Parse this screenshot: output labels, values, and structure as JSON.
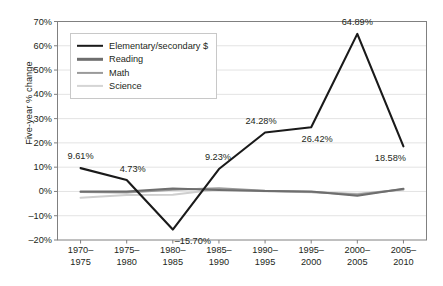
{
  "chart_data": {
    "type": "line",
    "title": "",
    "xlabel": "",
    "ylabel": "Five-year % change",
    "ylim": [
      -20,
      70
    ],
    "grid": true,
    "legend_position": "upper-left",
    "categories": [
      "1970–1975",
      "1975–1980",
      "1980–1985",
      "1985–1990",
      "1990–1995",
      "1995–2000",
      "2000–2005",
      "2005–2010"
    ],
    "category_lines": [
      [
        "1970–",
        "1975"
      ],
      [
        "1975–",
        "1980"
      ],
      [
        "1980–",
        "1985"
      ],
      [
        "1985–",
        "1990"
      ],
      [
        "1990–",
        "1995"
      ],
      [
        "1995–",
        "2000"
      ],
      [
        "2000–",
        "2005"
      ],
      [
        "2005–",
        "2010"
      ]
    ],
    "ytick_labels": [
      "70%",
      "60%",
      "50%",
      "40%",
      "30%",
      "20%",
      "10%",
      "0%",
      "–10%",
      "–20%"
    ],
    "ytick_values": [
      70,
      60,
      50,
      40,
      30,
      20,
      10,
      0,
      -10,
      -20
    ],
    "series": [
      {
        "name": "Elementary/secondary $",
        "color": "#1a1a1a",
        "width": 2.1,
        "values": [
          9.61,
          4.73,
          -15.7,
          9.23,
          24.28,
          26.42,
          64.89,
          18.58
        ],
        "point_labels": [
          "9.61%",
          "4.73%",
          "–15.70%",
          "9.23%",
          "24.28%",
          "26.42%",
          "64.89%",
          "18.58%"
        ],
        "label_offsets": [
          {
            "dx": 0,
            "dy": -12
          },
          {
            "dx": 6,
            "dy": -11
          },
          {
            "dx": 20,
            "dy": 11
          },
          {
            "dx": -1,
            "dy": -12
          },
          {
            "dx": -4,
            "dy": -11
          },
          {
            "dx": 6,
            "dy": 12
          },
          {
            "dx": 0,
            "dy": -12
          },
          {
            "dx": -13,
            "dy": 12
          }
        ]
      },
      {
        "name": "Reading",
        "color": "#6e6e6e",
        "width": 2.0,
        "values": [
          0.0,
          0.0,
          1.2,
          0.6,
          0.2,
          0.0,
          -1.8,
          1.1
        ]
      },
      {
        "name": "Math",
        "color": "#9a9a9a",
        "width": 2.0,
        "values": [
          -0.2,
          -0.4,
          0.7,
          1.3,
          0.3,
          -0.2,
          -1.3,
          0.9
        ]
      },
      {
        "name": "Science",
        "color": "#cfcfcf",
        "width": 2.0,
        "values": [
          -2.6,
          -1.5,
          -1.4,
          0.9,
          0.1,
          -0.3,
          -1.0,
          0.7
        ]
      }
    ]
  },
  "legend": {
    "items": [
      {
        "label": "Elementary/secondary $",
        "color": "#1a1a1a",
        "thickness": 2.4
      },
      {
        "label": "Reading",
        "color": "#6e6e6e",
        "thickness": 2.4
      },
      {
        "label": "Math",
        "color": "#9a9a9a",
        "thickness": 2.2
      },
      {
        "label": "Science",
        "color": "#d5d5d5",
        "thickness": 2.2
      }
    ]
  },
  "style": {
    "axis_color": "#808080",
    "grid_color": "#e3e3e3",
    "text_color": "#231f20",
    "background": "#ffffff"
  }
}
